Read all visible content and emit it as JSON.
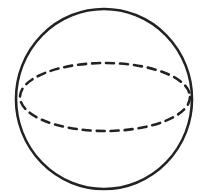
{
  "figure": {
    "stroke_color": "#222222",
    "background_color": "#ffffff"
  }
}
